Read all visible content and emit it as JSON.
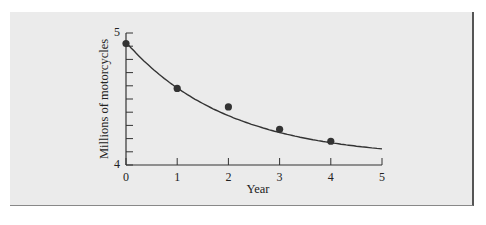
{
  "chart_data": {
    "type": "scatter",
    "title": "",
    "xlabel": "Year",
    "ylabel": "Millions of motorcycles",
    "xlim": [
      0,
      5
    ],
    "ylim": [
      4,
      5
    ],
    "x_ticks": [
      "0",
      "1",
      "2",
      "3",
      "4",
      "5"
    ],
    "y_tick_labels": [
      "4",
      "5"
    ],
    "y_minor_tick_step": 0.1,
    "grid": false,
    "legend": null,
    "series": [
      {
        "name": "Observed",
        "type": "scatter",
        "x": [
          0,
          1,
          2,
          3,
          4
        ],
        "y": [
          4.92,
          4.58,
          4.44,
          4.27,
          4.18
        ]
      },
      {
        "name": "Fitted exponential decay curve",
        "type": "line",
        "x": [
          0,
          0.5,
          1,
          1.5,
          2,
          2.5,
          3,
          3.5,
          4,
          4.5,
          5
        ],
        "y": [
          4.93,
          4.72,
          4.56,
          4.44,
          4.35,
          4.28,
          4.23,
          4.19,
          4.16,
          4.13,
          4.11
        ]
      }
    ],
    "colors": {
      "background": "#ebebeb",
      "ink": "#333333"
    }
  }
}
